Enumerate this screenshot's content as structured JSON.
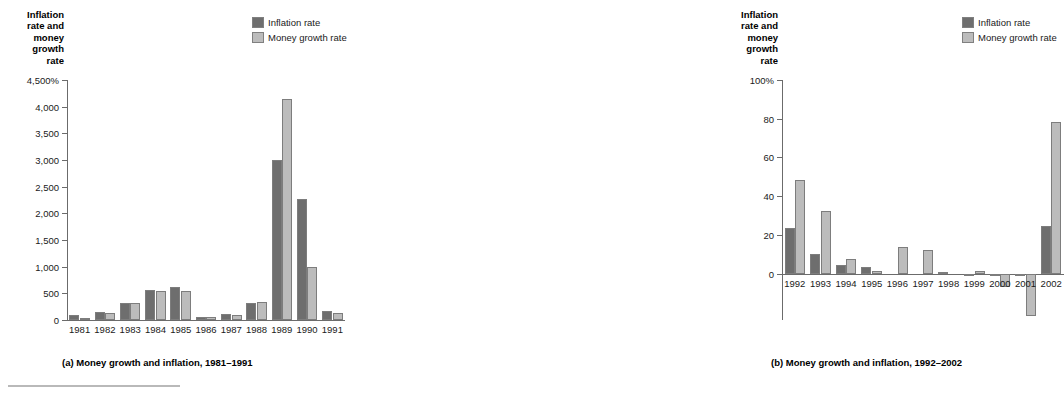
{
  "figure": {
    "legend": {
      "items": [
        {
          "label": "Inflation rate",
          "key": "inflation",
          "color": "#6e6e6e",
          "swatch": "dark-swatch-icon"
        },
        {
          "label": "Money growth rate",
          "key": "money_growth",
          "color": "#bcbcbc",
          "swatch": "light-swatch-icon"
        }
      ]
    },
    "panels": [
      {
        "id": "a",
        "axis_title": "Inflation\nrate and\nmoney\ngrowth\nrate",
        "caption": "(a) Money growth and inflation, 1981–1991",
        "y_ticks": [
          "0",
          "500",
          "1,000",
          "1,500",
          "2,000",
          "2,500",
          "3,000",
          "3,500",
          "4,000",
          "4,500%"
        ]
      },
      {
        "id": "b",
        "axis_title": "Inflation\nrate and\nmoney\ngrowth\nrate",
        "caption": "(b) Money growth and inflation, 1992–2002",
        "y_ticks": [
          "0",
          "20",
          "40",
          "60",
          "80",
          "100%"
        ]
      }
    ]
  },
  "chart_data": [
    {
      "type": "bar",
      "panel": "a",
      "title": "(a) Money growth and inflation, 1981–1991",
      "xlabel": "",
      "ylabel": "Inflation rate and money growth rate",
      "categories": [
        "1981",
        "1982",
        "1983",
        "1984",
        "1985",
        "1986",
        "1987",
        "1988",
        "1989",
        "1990",
        "1991"
      ],
      "series": [
        {
          "name": "Inflation rate",
          "color": "#6e6e6e",
          "values": [
            85,
            150,
            310,
            570,
            615,
            65,
            120,
            320,
            3005,
            2270,
            165
          ]
        },
        {
          "name": "Money growth rate",
          "color": "#bcbcbc",
          "values": [
            45,
            130,
            320,
            535,
            535,
            65,
            95,
            335,
            4150,
            990,
            135
          ]
        }
      ],
      "ylim": [
        0,
        4500
      ],
      "ytick_step": 500,
      "grid": false,
      "legend_position": "top-right"
    },
    {
      "type": "bar",
      "panel": "b",
      "title": "(b) Money growth and inflation, 1992–2002",
      "xlabel": "",
      "ylabel": "Inflation rate and money growth rate",
      "categories": [
        "1992",
        "1993",
        "1994",
        "1995",
        "1996",
        "1997",
        "1998",
        "1999",
        "2000",
        "2001",
        "2002"
      ],
      "series": [
        {
          "name": "Inflation rate",
          "color": "#6e6e6e",
          "values": [
            23.5,
            10.0,
            4.2,
            3.2,
            0.0,
            0.4,
            0.8,
            -1.0,
            -1.5,
            -1.3,
            24.8
          ]
        },
        {
          "name": "Money growth rate",
          "color": "#bcbcbc",
          "values": [
            48.2,
            32.5,
            7.5,
            1.2,
            13.8,
            12.2,
            0.0,
            1.4,
            -7.0,
            -22.0,
            78.5
          ]
        }
      ],
      "ylim": [
        -24,
        100
      ],
      "ytick_step": 20,
      "grid": false,
      "legend_position": "top-right"
    }
  ]
}
